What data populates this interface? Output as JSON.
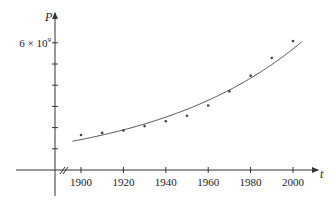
{
  "chart_data": {
    "type": "scatter",
    "title": "",
    "xlabel": "t",
    "ylabel": "P",
    "x_ticks": [
      1900,
      1920,
      1940,
      1960,
      1980,
      2000
    ],
    "y_ticks_count": 6,
    "y_tick_labels": [
      {
        "value": 6000000000,
        "label": "6 × 10⁹"
      }
    ],
    "xlim": [
      1890,
      2010
    ],
    "ylim": [
      0,
      7000000000
    ],
    "grid": false,
    "legend": null,
    "axis_break": "x-axis broken near origin (//)",
    "series": [
      {
        "name": "population data",
        "kind": "points",
        "x": [
          1900,
          1910,
          1920,
          1930,
          1940,
          1950,
          1960,
          1970,
          1980,
          1990,
          2000
        ],
        "values": [
          1650000000,
          1750000000,
          1860000000,
          2070000000,
          2300000000,
          2560000000,
          3040000000,
          3710000000,
          4450000000,
          5280000000,
          6080000000
        ]
      },
      {
        "name": "exponential model",
        "kind": "curve",
        "formula": "P = 1.436e9 * 1.0139^(t-1900)",
        "x_range": [
          1896,
          2004
        ]
      }
    ]
  },
  "labels": {
    "y_axis": "P",
    "x_axis": "t",
    "y_tick_top": "6 × 10",
    "y_tick_top_exp": "9",
    "x_tick_labels": [
      "1900",
      "1920",
      "1940",
      "1960",
      "1980",
      "2000"
    ]
  }
}
